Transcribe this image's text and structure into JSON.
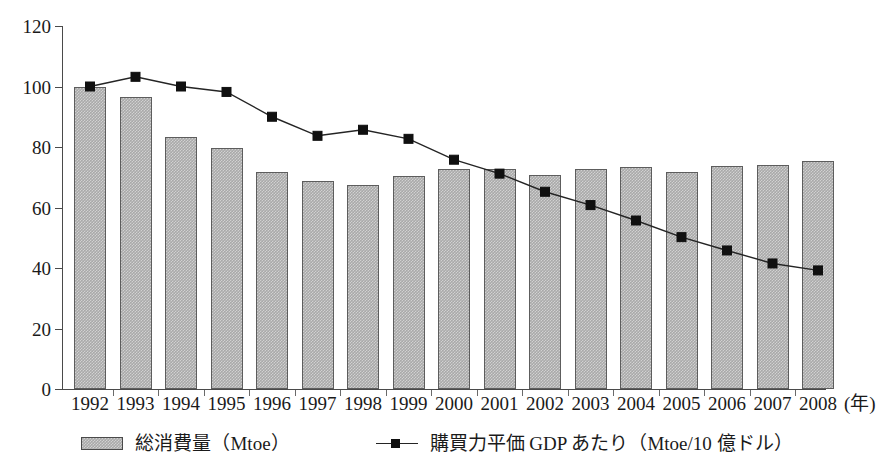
{
  "chart_data": {
    "type": "bar",
    "title": "",
    "subtitle": "",
    "xlabel": "年",
    "ylabel": "",
    "xlim_categories": [
      "1992",
      "1993",
      "1994",
      "1995",
      "1996",
      "1997",
      "1998",
      "1999",
      "2000",
      "2001",
      "2002",
      "2003",
      "2004",
      "2005",
      "2006",
      "2007",
      "2008"
    ],
    "ylim": [
      0,
      120
    ],
    "y_ticks": [
      0,
      20,
      40,
      60,
      80,
      100,
      120
    ],
    "grid": false,
    "legend_position": "bottom",
    "categories": [
      "1992",
      "1993",
      "1994",
      "1995",
      "1996",
      "1997",
      "1998",
      "1999",
      "2000",
      "2001",
      "2002",
      "2003",
      "2004",
      "2005",
      "2006",
      "2007",
      "2008"
    ],
    "series": [
      {
        "name": "総消費量（Mtoe）",
        "type": "bar",
        "values": [
          100,
          96.5,
          83.2,
          79.8,
          71.8,
          68.8,
          67.6,
          70.3,
          72.7,
          72.6,
          70.8,
          72.6,
          73.3,
          71.9,
          73.6,
          74.2,
          75.5
        ]
      },
      {
        "name": "購買力平価 GDP あたり（Mtoe/10 億ドル）",
        "type": "line",
        "marker": "square",
        "values": [
          100,
          103.2,
          100,
          98.2,
          90,
          83.7,
          85.7,
          82.7,
          75.8,
          71.2,
          65.2,
          60.8,
          55.7,
          50.2,
          45.8,
          41.5,
          39.2
        ]
      }
    ]
  },
  "axes": {
    "y_tick_labels": [
      "0",
      "20",
      "40",
      "60",
      "80",
      "100",
      "120"
    ],
    "x_tick_labels": [
      "1992",
      "1993",
      "1994",
      "1995",
      "1996",
      "1997",
      "1998",
      "1999",
      "2000",
      "2001",
      "2002",
      "2003",
      "2004",
      "2005",
      "2006",
      "2007",
      "2008"
    ],
    "x_unit_label": "(年)"
  },
  "legend": {
    "entries": [
      {
        "label": "総消費量（Mtoe）",
        "swatch": "bar-swatch"
      },
      {
        "label": "購買力平価 GDP あたり（Mtoe/10 億ドル）",
        "swatch": "line-marker-swatch"
      }
    ]
  },
  "colors": {
    "bar_fill": "#a9a9a9",
    "bar_border": "#5d5d5d",
    "line": "#242424",
    "marker": "#101010",
    "axis": "#4a4a4a",
    "text": "#1a1a1a",
    "background": "#ffffff"
  }
}
